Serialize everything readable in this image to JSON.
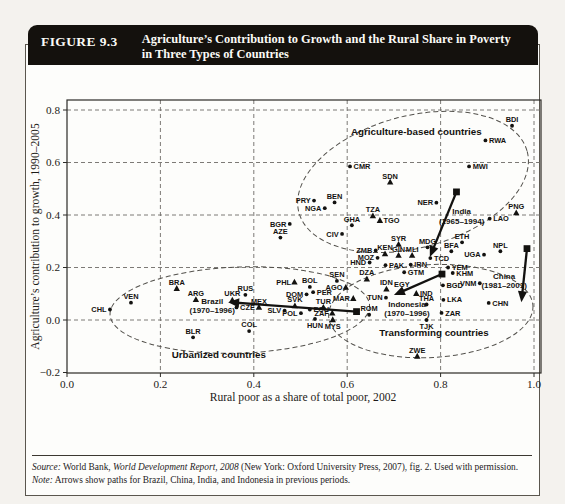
{
  "figure": {
    "label": "FIGURE 9.3",
    "title_line1": "Agriculture’s Contribution to Growth and the Rural Share in Poverty",
    "title_line2": "in Three Types of Countries"
  },
  "source": {
    "source_label": "Source:",
    "source_pre": " World Bank, ",
    "source_italic": "World Development Report, 2008",
    "source_post": " (New York: Oxford University Press, 2007), fig. 2. Used with permission.",
    "note_label": "Note:",
    "note_text": " Arrows show paths for Brazil, China, India, and Indonesia in previous periods."
  },
  "chart_data": {
    "type": "scatter",
    "xlabel": "Rural poor as a share of total poor, 2002",
    "ylabel": "Agriculture’s contribution to growth, 1990–2005",
    "xlim": [
      0,
      1.015
    ],
    "ylim": [
      -0.202,
      0.838
    ],
    "grid": "dashed",
    "x_ticks": [
      0,
      0.2,
      0.4,
      0.6,
      0.8,
      1.0
    ],
    "x_tick_labels": [
      "0.0",
      "0.2",
      "0.4",
      "0.6",
      "0.8",
      "1.0"
    ],
    "y_ticks": [
      0.8,
      0.6,
      0.4,
      0.2,
      0.0,
      -0.2
    ],
    "y_tick_labels": [
      "0.8",
      "0.6",
      "0.4",
      "0.2",
      "0.0",
      "−0.2"
    ],
    "x_gridlines": [
      0.2,
      0.4,
      0.6,
      0.8,
      1.0
    ],
    "y_gridlines": [
      0.0,
      0.2,
      0.4,
      0.6,
      0.8
    ],
    "clusters": [
      {
        "name": "Agriculture-based countries",
        "x": 0.748,
        "y": 0.715
      },
      {
        "name": "Urbanized countries",
        "x": 0.325,
        "y": -0.135
      },
      {
        "name": "Transforming countries",
        "x": 0.786,
        "y": -0.048
      }
    ],
    "ellipses": [
      {
        "group": "agriculture-based",
        "cx": 0.741,
        "cy": 0.526,
        "rx": 0.253,
        "ry": 0.251,
        "rot": -15
      },
      {
        "group": "urbanized",
        "cx": 0.37,
        "cy": 0.038,
        "rx": 0.278,
        "ry": 0.164,
        "rot": -2
      },
      {
        "group": "transforming",
        "cx": 0.779,
        "cy": 0.034,
        "rx": 0.219,
        "ry": 0.177,
        "rot": -3
      }
    ],
    "paths": [
      {
        "name": "Brazil",
        "from": [
          0.62,
          0.032
        ],
        "to": [
          0.345,
          0.068
        ],
        "label": [
          "Brazil",
          "(1970–1996)"
        ],
        "lx": 0.311,
        "ly": 0.062
      },
      {
        "name": "India",
        "from": [
          0.834,
          0.488
        ],
        "to": [
          0.777,
          0.24
        ],
        "label": [
          "India",
          "(1965–1994)"
        ],
        "lx": 0.845,
        "ly": 0.402
      },
      {
        "name": "Indonesia",
        "from": [
          0.803,
          0.175
        ],
        "to": [
          0.7,
          0.095
        ],
        "label": [
          "Indonesia",
          "(1970–1996)"
        ],
        "lx": 0.728,
        "ly": 0.05
      },
      {
        "name": "China",
        "from": [
          0.985,
          0.272
        ],
        "to": [
          0.973,
          0.068
        ],
        "label": [
          "China",
          "(1981–2001)"
        ],
        "lx": 0.936,
        "ly": 0.158
      }
    ],
    "points": [
      {
        "code": "CHL",
        "x": 0.092,
        "y": 0.04,
        "m": "dot",
        "lp": "left"
      },
      {
        "code": "VEN",
        "x": 0.137,
        "y": 0.066,
        "m": "dot",
        "lp": "above"
      },
      {
        "code": "BRA",
        "x": 0.235,
        "y": 0.12,
        "m": "tri",
        "lp": "above"
      },
      {
        "code": "ARG",
        "x": 0.276,
        "y": 0.078,
        "m": "tri",
        "lp": "above"
      },
      {
        "code": "BLR",
        "x": 0.27,
        "y": -0.066,
        "m": "dot",
        "lp": "above"
      },
      {
        "code": "UKR",
        "x": 0.354,
        "y": 0.076,
        "m": "tri",
        "lp": "above"
      },
      {
        "code": "RUS",
        "x": 0.382,
        "y": 0.096,
        "m": "dot",
        "lp": "above"
      },
      {
        "code": "CZE",
        "x": 0.363,
        "y": 0.048,
        "m": "dot",
        "lp": "right"
      },
      {
        "code": "MEX",
        "x": 0.411,
        "y": 0.048,
        "m": "tri",
        "lp": "above"
      },
      {
        "code": "COL",
        "x": 0.39,
        "y": -0.042,
        "m": "dot",
        "lp": "above"
      },
      {
        "code": "SLV",
        "x": 0.466,
        "y": 0.036,
        "m": "dot",
        "lp": "left"
      },
      {
        "code": "SVK",
        "x": 0.488,
        "y": 0.054,
        "m": "tri",
        "lp": "above"
      },
      {
        "code": "POL",
        "x": 0.501,
        "y": 0.026,
        "m": "dot",
        "lp": "left"
      },
      {
        "code": "ECU",
        "x": 0.52,
        "y": 0.04,
        "m": "dot",
        "lp": "right"
      },
      {
        "code": "DOM",
        "x": 0.513,
        "y": 0.098,
        "m": "dot",
        "lp": "left"
      },
      {
        "code": "PHL",
        "x": 0.487,
        "y": 0.144,
        "m": "tri",
        "lp": "left"
      },
      {
        "code": "BOL",
        "x": 0.52,
        "y": 0.126,
        "m": "dot",
        "lp": "above"
      },
      {
        "code": "PER",
        "x": 0.527,
        "y": 0.106,
        "m": "dot",
        "lp": "right"
      },
      {
        "code": "TUR",
        "x": 0.549,
        "y": 0.048,
        "m": "tri",
        "lp": "above"
      },
      {
        "code": "ZAF",
        "x": 0.568,
        "y": 0.026,
        "m": "tri",
        "lp": "left"
      },
      {
        "code": "HUN",
        "x": 0.531,
        "y": 0.004,
        "m": "dot",
        "lp": "below"
      },
      {
        "code": "MYS",
        "x": 0.569,
        "y": 0.001,
        "m": "tri",
        "lp": "below"
      },
      {
        "code": "BGR",
        "x": 0.477,
        "y": 0.366,
        "m": "dot",
        "lp": "left"
      },
      {
        "code": "AZE",
        "x": 0.457,
        "y": 0.314,
        "m": "dot",
        "lp": "above"
      },
      {
        "code": "CMR",
        "x": 0.606,
        "y": 0.585,
        "m": "dot",
        "lp": "right"
      },
      {
        "code": "SDN",
        "x": 0.692,
        "y": 0.525,
        "m": "tri",
        "lp": "above"
      },
      {
        "code": "PRY",
        "x": 0.529,
        "y": 0.455,
        "m": "dot",
        "lp": "left"
      },
      {
        "code": "BEN",
        "x": 0.573,
        "y": 0.448,
        "m": "dot",
        "lp": "above"
      },
      {
        "code": "NGA",
        "x": 0.552,
        "y": 0.426,
        "m": "dot",
        "lp": "left"
      },
      {
        "code": "NER",
        "x": 0.791,
        "y": 0.447,
        "m": "dot",
        "lp": "left"
      },
      {
        "code": "TZA",
        "x": 0.655,
        "y": 0.397,
        "m": "tri",
        "lp": "above"
      },
      {
        "code": "TGO",
        "x": 0.67,
        "y": 0.379,
        "m": "tri",
        "lp": "right"
      },
      {
        "code": "GHA",
        "x": 0.61,
        "y": 0.361,
        "m": "dot",
        "lp": "above"
      },
      {
        "code": "CIV",
        "x": 0.589,
        "y": 0.328,
        "m": "dot",
        "lp": "left"
      },
      {
        "code": "MWI",
        "x": 0.861,
        "y": 0.585,
        "m": "dot",
        "lp": "right"
      },
      {
        "code": "RWA",
        "x": 0.896,
        "y": 0.684,
        "m": "dot",
        "lp": "right"
      },
      {
        "code": "BDI",
        "x": 0.953,
        "y": 0.74,
        "m": "dot",
        "lp": "above"
      },
      {
        "code": "LAO",
        "x": 0.905,
        "y": 0.386,
        "m": "dot",
        "lp": "right"
      },
      {
        "code": "PNG",
        "x": 0.962,
        "y": 0.408,
        "m": "tri",
        "lp": "above"
      },
      {
        "code": "ETH",
        "x": 0.846,
        "y": 0.296,
        "m": "dot",
        "lp": "above"
      },
      {
        "code": "NPL",
        "x": 0.928,
        "y": 0.262,
        "m": "dot",
        "lp": "above"
      },
      {
        "code": "UGA",
        "x": 0.893,
        "y": 0.249,
        "m": "dot",
        "lp": "left"
      },
      {
        "code": "BFA",
        "x": 0.823,
        "y": 0.262,
        "m": "dot",
        "lp": "above"
      },
      {
        "code": "MDG",
        "x": 0.772,
        "y": 0.277,
        "m": "dot",
        "lp": "above"
      },
      {
        "code": "SYR",
        "x": 0.71,
        "y": 0.288,
        "m": "tri",
        "lp": "above"
      },
      {
        "code": "ZMB",
        "x": 0.661,
        "y": 0.265,
        "m": "dot",
        "lp": "left"
      },
      {
        "code": "KEN",
        "x": 0.681,
        "y": 0.252,
        "m": "tri",
        "lp": "above"
      },
      {
        "code": "MOZ",
        "x": 0.665,
        "y": 0.237,
        "m": "dot",
        "lp": "left"
      },
      {
        "code": "GIN",
        "x": 0.71,
        "y": 0.246,
        "m": "tri",
        "lp": "above"
      },
      {
        "code": "MLI",
        "x": 0.739,
        "y": 0.246,
        "m": "tri",
        "lp": "above"
      },
      {
        "code": "TCD",
        "x": 0.778,
        "y": 0.236,
        "m": "dot",
        "lp": "right"
      },
      {
        "code": "HND",
        "x": 0.648,
        "y": 0.219,
        "m": "dot",
        "lp": "left"
      },
      {
        "code": "PAK",
        "x": 0.682,
        "y": 0.209,
        "m": "dot",
        "lp": "right"
      },
      {
        "code": "IRN",
        "x": 0.736,
        "y": 0.211,
        "m": "dot",
        "lp": "right"
      },
      {
        "code": "YEM",
        "x": 0.816,
        "y": 0.2,
        "m": "dot",
        "lp": "right"
      },
      {
        "code": "KHM",
        "x": 0.826,
        "y": 0.179,
        "m": "dot",
        "lp": "right"
      },
      {
        "code": "GTM",
        "x": 0.722,
        "y": 0.182,
        "m": "dot",
        "lp": "right"
      },
      {
        "code": "SEN",
        "x": 0.578,
        "y": 0.149,
        "m": "dot",
        "lp": "above"
      },
      {
        "code": "DZA",
        "x": 0.642,
        "y": 0.156,
        "m": "tri",
        "lp": "above"
      },
      {
        "code": "AGO",
        "x": 0.597,
        "y": 0.124,
        "m": "tri",
        "lp": "left"
      },
      {
        "code": "IDN",
        "x": 0.684,
        "y": 0.118,
        "m": "tri",
        "lp": "above"
      },
      {
        "code": "EGY",
        "x": 0.717,
        "y": 0.113,
        "m": "dot",
        "lp": "above"
      },
      {
        "code": "IND",
        "x": 0.748,
        "y": 0.101,
        "m": "tri",
        "lp": "right"
      },
      {
        "code": "BGD",
        "x": 0.805,
        "y": 0.132,
        "m": "dot",
        "lp": "right"
      },
      {
        "code": "VNM",
        "x": 0.884,
        "y": 0.14,
        "m": "dot",
        "lp": "left"
      },
      {
        "code": "CHN",
        "x": 0.903,
        "y": 0.065,
        "m": "dot",
        "lp": "right"
      },
      {
        "code": "THA",
        "x": 0.77,
        "y": 0.059,
        "m": "dot",
        "lp": "above"
      },
      {
        "code": "LKA",
        "x": 0.806,
        "y": 0.077,
        "m": "dot",
        "lp": "right"
      },
      {
        "code": "ZAR",
        "x": 0.802,
        "y": 0.027,
        "m": "dot",
        "lp": "right"
      },
      {
        "code": "TJK",
        "x": 0.77,
        "y": 0.0,
        "m": "dot",
        "lp": "below"
      },
      {
        "code": "TUN",
        "x": 0.683,
        "y": 0.085,
        "m": "dot",
        "lp": "left"
      },
      {
        "code": "MAR",
        "x": 0.613,
        "y": 0.082,
        "m": "tri",
        "lp": "left"
      },
      {
        "code": "ROM",
        "x": 0.647,
        "y": 0.02,
        "m": "dot",
        "lp": "above"
      },
      {
        "code": "ZWE",
        "x": 0.75,
        "y": -0.138,
        "m": "tri",
        "lp": "above"
      }
    ]
  }
}
